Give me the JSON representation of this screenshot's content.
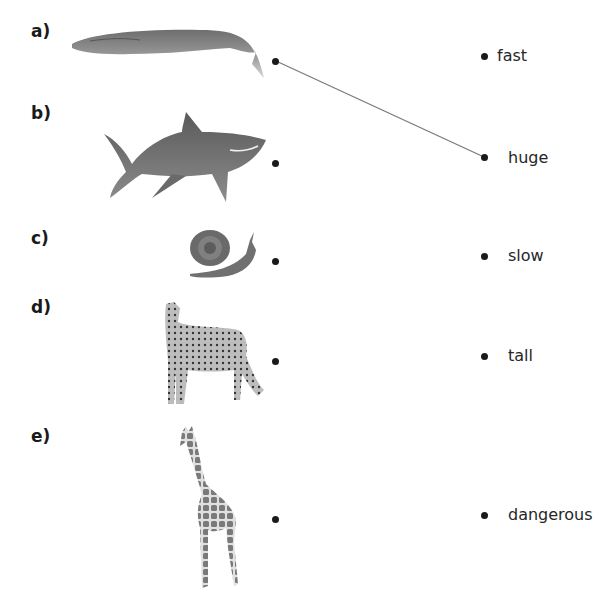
{
  "worksheet": {
    "items": [
      {
        "label": "a)",
        "animal": "whale"
      },
      {
        "label": "b)",
        "animal": "shark"
      },
      {
        "label": "c)",
        "animal": "snail"
      },
      {
        "label": "d)",
        "animal": "cheetah"
      },
      {
        "label": "e)",
        "animal": "giraffe"
      }
    ],
    "words": [
      "fast",
      "huge",
      "slow",
      "tall",
      "dangerous"
    ],
    "drawn_lines": [
      {
        "from": "a)",
        "to": "huge"
      }
    ],
    "colors": {
      "ink": "#1a1a1a",
      "line": "#7a7a7a",
      "animal_gray": "#808080"
    }
  }
}
